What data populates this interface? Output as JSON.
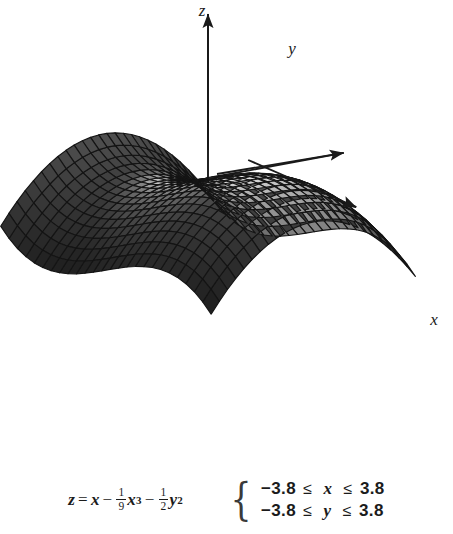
{
  "figure": {
    "type": "surface-plot-3d",
    "axes": [
      {
        "name": "z-axis",
        "label": "z",
        "direction": "up",
        "label_x": 202,
        "label_y": 16
      },
      {
        "name": "y-axis",
        "label": "y",
        "direction": "up-right",
        "label_x": 292,
        "label_y": 54
      },
      {
        "name": "x-axis",
        "label": "x",
        "direction": "down-right",
        "label_x": 434,
        "label_y": 325
      }
    ],
    "colors": {
      "background": "#ffffff",
      "mesh_line": "#141414",
      "surface_light": "#f2f2f2",
      "surface_mid": "#9a9a9a",
      "surface_dark": "#2a2a2a",
      "surface_darkest": "#111111",
      "axis": "#1a1a1a",
      "text": "#1b1b1b",
      "brace": "#3a3a3a"
    }
  },
  "equation": {
    "lhs": "z",
    "equals": "=",
    "term1": "x",
    "op1": "−",
    "frac1_num": "1",
    "frac1_den": "9",
    "term2": "x",
    "term2_exp": "3",
    "op2": "−",
    "frac2_num": "1",
    "frac2_den": "2",
    "term3": "y",
    "term3_exp": "2",
    "plain": "z = x - (1/9)x^3 - (1/2)y^2"
  },
  "constraints": {
    "brace": "{",
    "rows": [
      {
        "lower": "−3.8",
        "rel1": "≤",
        "var": "x",
        "rel2": "≤",
        "upper": "3.8"
      },
      {
        "lower": "−3.8",
        "rel1": "≤",
        "var": "y",
        "rel2": "≤",
        "upper": "3.8"
      }
    ]
  },
  "chart_data": {
    "type": "surface",
    "title": "",
    "xlabel": "x",
    "ylabel": "y",
    "zlabel": "z",
    "function": "z = x - (1/9)*x^3 - (1/2)*y^2",
    "xlim": [
      -3.8,
      3.8
    ],
    "ylim": [
      -3.8,
      3.8
    ],
    "grid_n": 26,
    "legend": "none",
    "grid": false,
    "shading": "grayscale-lighting",
    "projection": {
      "azimuth_deg": 35,
      "elevation_deg": 22,
      "scale_x": 34,
      "scale_y": 34,
      "scale_z": 19,
      "origin_px": [
        208,
        178
      ]
    },
    "x": [
      -3.8,
      -3.496,
      -3.192,
      -2.888,
      -2.584,
      -2.28,
      -1.976,
      -1.672,
      -1.368,
      -1.064,
      -0.76,
      -0.456,
      -0.152,
      0.152,
      0.456,
      0.76,
      1.064,
      1.368,
      1.672,
      1.976,
      2.28,
      2.584,
      2.888,
      3.192,
      3.496,
      3.8
    ],
    "y": [
      -3.8,
      -3.496,
      -3.192,
      -2.888,
      -2.584,
      -2.28,
      -1.976,
      -1.672,
      -1.368,
      -1.064,
      -0.76,
      -0.456,
      -0.152,
      0.152,
      0.456,
      0.76,
      1.064,
      1.368,
      1.672,
      1.976,
      2.28,
      2.584,
      2.888,
      3.192,
      3.496,
      3.8
    ],
    "z_extrema": {
      "local_max": {
        "x": -1.732,
        "y": 0.0,
        "z": -1.155
      },
      "local_min_ridge": {
        "x": 1.732,
        "y": 0.0,
        "z": 1.155
      },
      "corner_min": {
        "x": 3.8,
        "y": 3.8,
        "z": -13.32
      }
    }
  }
}
